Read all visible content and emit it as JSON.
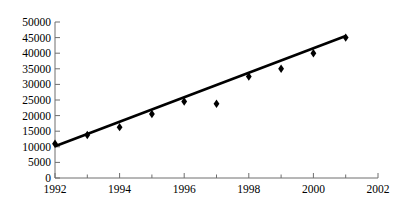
{
  "chart_data": {
    "type": "scatter",
    "title": "",
    "subtitle": "",
    "xlabel": "",
    "ylabel": "",
    "xlim": [
      1992,
      2002
    ],
    "ylim": [
      0,
      50000
    ],
    "grid": false,
    "legend": false,
    "legend_position": "none",
    "x_tick_labels": [
      "1992",
      "1994",
      "1996",
      "1998",
      "2000",
      "2002"
    ],
    "x_tick_values": [
      1992,
      1994,
      1996,
      1998,
      2000,
      2002
    ],
    "x_minor_tick_values": [
      1993,
      1995,
      1997,
      1999,
      2001
    ],
    "y_tick_labels": [
      "0",
      "5000",
      "10000",
      "15000",
      "20000",
      "25000",
      "30000",
      "35000",
      "40000",
      "45000",
      "50000"
    ],
    "y_tick_values": [
      0,
      5000,
      10000,
      15000,
      20000,
      25000,
      30000,
      35000,
      40000,
      45000,
      50000
    ],
    "marker": "diamond",
    "marker_color": "#000000",
    "line_color": "#000000",
    "axis_color": "#6e6e6e",
    "x": [
      1992,
      1993,
      1994,
      1995,
      1996,
      1997,
      1998,
      1999,
      2000,
      2001
    ],
    "values": [
      11000,
      13800,
      16300,
      20500,
      24500,
      23800,
      32500,
      35000,
      40000,
      45000
    ],
    "series": [
      {
        "name": "data",
        "type": "scatter",
        "x": [
          1992,
          1993,
          1994,
          1995,
          1996,
          1997,
          1998,
          1999,
          2000,
          2001
        ],
        "values": [
          11000,
          13800,
          16300,
          20500,
          24500,
          23800,
          32500,
          35000,
          40000,
          45000
        ]
      },
      {
        "name": "trendline",
        "type": "line",
        "x": [
          1992,
          2001
        ],
        "values": [
          10200,
          45500
        ]
      }
    ]
  }
}
